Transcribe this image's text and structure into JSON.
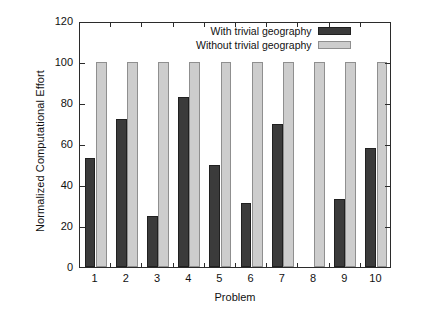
{
  "chart_data": {
    "type": "bar",
    "title": "",
    "xlabel": "Problem",
    "ylabel": "Normalized Computational Effort",
    "categories": [
      "1",
      "2",
      "3",
      "4",
      "5",
      "6",
      "7",
      "8",
      "9",
      "10"
    ],
    "series": [
      {
        "name": "With trivial geography",
        "color": "#3b3b3b",
        "values": [
          53,
          72,
          25,
          83,
          50,
          31,
          70,
          0,
          33,
          58
        ]
      },
      {
        "name": "Without trivial geography",
        "color": "#cdcdcd",
        "values": [
          100,
          100,
          100,
          100,
          100,
          100,
          100,
          100,
          100,
          100
        ]
      }
    ],
    "ylim": [
      0,
      120
    ],
    "yticks": [
      0,
      20,
      40,
      60,
      80,
      100,
      120
    ],
    "ytick_labels": [
      "0",
      "20",
      "40",
      "60",
      "80",
      "100",
      "120"
    ],
    "grid": false,
    "legend_position": "top-right"
  },
  "legend": {
    "entries": [
      {
        "label": "With trivial geography",
        "swatch": "dark-swatch"
      },
      {
        "label": "Without trivial geography",
        "swatch": "light-swatch"
      }
    ]
  }
}
